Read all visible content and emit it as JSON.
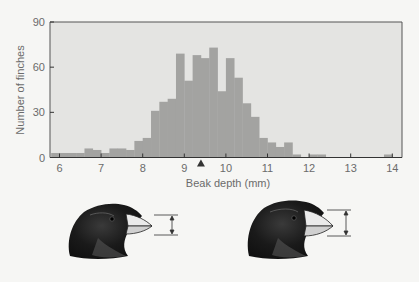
{
  "chart_data": {
    "type": "bar",
    "subtype": "histogram",
    "title": "",
    "xlabel": "Beak depth (mm)",
    "ylabel": "Number of finches",
    "xlim": [
      5.8,
      14.3
    ],
    "ylim": [
      0,
      90
    ],
    "xticks": [
      6,
      7,
      8,
      9,
      10,
      11,
      12,
      13,
      14
    ],
    "yticks": [
      0,
      30,
      60,
      90
    ],
    "grid": false,
    "legend": null,
    "bin_width": 0.2,
    "bins": [
      {
        "start": 5.8,
        "end": 6.0,
        "count": 3
      },
      {
        "start": 6.0,
        "end": 6.2,
        "count": 3
      },
      {
        "start": 6.2,
        "end": 6.4,
        "count": 3
      },
      {
        "start": 6.4,
        "end": 6.6,
        "count": 3
      },
      {
        "start": 6.6,
        "end": 6.8,
        "count": 6
      },
      {
        "start": 6.8,
        "end": 7.0,
        "count": 5
      },
      {
        "start": 7.0,
        "end": 7.2,
        "count": 3
      },
      {
        "start": 7.2,
        "end": 7.4,
        "count": 6
      },
      {
        "start": 7.4,
        "end": 7.6,
        "count": 6
      },
      {
        "start": 7.6,
        "end": 7.8,
        "count": 5
      },
      {
        "start": 7.8,
        "end": 8.0,
        "count": 11
      },
      {
        "start": 8.0,
        "end": 8.2,
        "count": 13
      },
      {
        "start": 8.2,
        "end": 8.4,
        "count": 31
      },
      {
        "start": 8.4,
        "end": 8.6,
        "count": 37
      },
      {
        "start": 8.6,
        "end": 8.8,
        "count": 39
      },
      {
        "start": 8.8,
        "end": 9.0,
        "count": 69
      },
      {
        "start": 9.0,
        "end": 9.2,
        "count": 51
      },
      {
        "start": 9.2,
        "end": 9.4,
        "count": 68
      },
      {
        "start": 9.4,
        "end": 9.6,
        "count": 66
      },
      {
        "start": 9.6,
        "end": 9.8,
        "count": 73
      },
      {
        "start": 9.8,
        "end": 10.0,
        "count": 44
      },
      {
        "start": 10.0,
        "end": 10.2,
        "count": 66
      },
      {
        "start": 10.2,
        "end": 10.4,
        "count": 53
      },
      {
        "start": 10.4,
        "end": 10.6,
        "count": 36
      },
      {
        "start": 10.6,
        "end": 10.8,
        "count": 27
      },
      {
        "start": 10.8,
        "end": 11.0,
        "count": 13
      },
      {
        "start": 11.0,
        "end": 11.2,
        "count": 10
      },
      {
        "start": 11.2,
        "end": 11.4,
        "count": 7
      },
      {
        "start": 11.4,
        "end": 11.6,
        "count": 10
      },
      {
        "start": 11.6,
        "end": 11.8,
        "count": 2
      },
      {
        "start": 12.0,
        "end": 12.2,
        "count": 2
      },
      {
        "start": 12.2,
        "end": 12.4,
        "count": 2
      },
      {
        "start": 13.8,
        "end": 14.0,
        "count": 2
      }
    ],
    "annotations": [
      {
        "type": "mean-marker",
        "shape": "triangle",
        "x": 9.4
      }
    ]
  },
  "illustration": {
    "description": "Two finch heads showing beak depth",
    "left_finch": {
      "label": "smaller beak depth"
    },
    "right_finch": {
      "label": "larger beak depth"
    }
  },
  "colors": {
    "page_bg": "#f6f6f4",
    "plot_bg": "#e4e4e2",
    "bar": "#a3a3a1",
    "axis": "#6b6b6b"
  }
}
